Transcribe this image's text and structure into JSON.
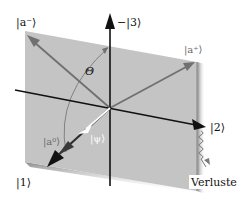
{
  "diagram": {
    "type": "vector-space-diagram",
    "plane": {
      "color": "#c4c4c4",
      "shadow_color": "#8e8e8e"
    },
    "axes": [
      {
        "id": "axis-1",
        "label": "|1⟩",
        "color": "#111111"
      },
      {
        "id": "axis-2",
        "label": "|2⟩",
        "color": "#111111"
      },
      {
        "id": "axis-3",
        "label": "−|3⟩",
        "color": "#111111"
      }
    ],
    "vectors": [
      {
        "id": "a-minus",
        "label": "|a⁻⟩",
        "color": "#707070"
      },
      {
        "id": "a-plus",
        "label": "|a⁺⟩",
        "color": "#707070"
      },
      {
        "id": "a-zero",
        "label": "|a⁰⟩",
        "color": "#3a3a3a"
      },
      {
        "id": "psi",
        "label": "|ψ⟩",
        "color": "#ffffff"
      }
    ],
    "angle": {
      "label": "Θ"
    },
    "loss": {
      "label": "Verluste"
    }
  }
}
